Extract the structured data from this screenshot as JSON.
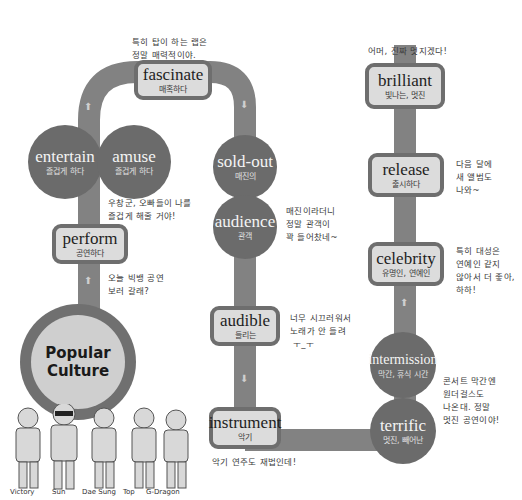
{
  "hub": {
    "line1": "Popular",
    "line2": "Culture"
  },
  "nodes": {
    "perform": {
      "en": "perform",
      "ko": "공연하다"
    },
    "entertain": {
      "en": "entertain",
      "ko": "즐겁게 하다"
    },
    "amuse": {
      "en": "amuse",
      "ko": "즐겁게 하다"
    },
    "fascinate": {
      "en": "fascinate",
      "ko": "매혹하다"
    },
    "sold_out": {
      "en": "sold-out",
      "ko": "매진의"
    },
    "audience": {
      "en": "audience",
      "ko": "관객"
    },
    "audible": {
      "en": "audible",
      "ko": "들리는"
    },
    "instrument": {
      "en": "instrument",
      "ko": "악기"
    },
    "terrific": {
      "en": "terrific",
      "ko": "멋진, 빼어난"
    },
    "intermission": {
      "en": "intermission",
      "ko": "막간, 휴식 시간"
    },
    "celebrity": {
      "en": "celebrity",
      "ko": "유명인, 연예인"
    },
    "release": {
      "en": "release",
      "ko": "출시하다"
    },
    "brilliant": {
      "en": "brilliant",
      "ko": "빛나는, 멋진"
    }
  },
  "notes": {
    "fascinate": "특히 탑이 하는 랩은\n정말 매력적이야.",
    "amuse": "우창군, 오빠들이 나를\n즐겁게 해줄 거야!",
    "perform": "오늘 빅뱅 공연\n보러 갈래?",
    "audience": "매진이라더니\n정말 관객이\n꽉 들어찼네~",
    "audible": "너무 시끄러워서\n노래가 안 들려\n ㅜ_ㅜ",
    "instrument": "악기 연주도 재법인데!",
    "intermission": "콘서트 막간엔\n원더걸스도\n나온대. 정말\n멋진 공연이야!",
    "celebrity": "특히 대성은\n연예인 같지\n않아서 더 좋아,\n하하!",
    "release": "다음 달에\n새 앨범도\n나와~",
    "brilliant": "어머, 진짜 멋지겠다!"
  },
  "members": [
    "Victory",
    "Sun",
    "Dae Sung",
    "Top",
    "G-Dragon"
  ],
  "colors": {
    "track": "#808080",
    "circle": "#6b6b6b",
    "box_fill": "#dcdcdc",
    "box_border": "#6e6e6e",
    "hub_fill": "#cfcfcf",
    "arrow": "#d0d0d0"
  },
  "arrows": {
    "up": "⬆",
    "down": "⬇"
  }
}
